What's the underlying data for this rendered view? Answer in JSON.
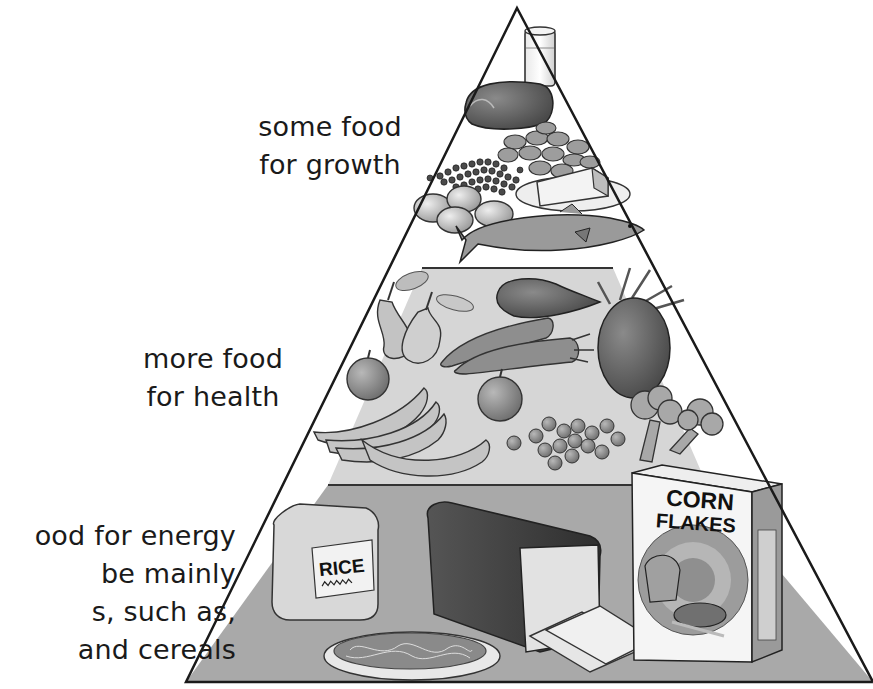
{
  "diagram": {
    "type": "food-pyramid",
    "colors": {
      "outline": "#1a1a1a",
      "tier_top": "#ffffff",
      "tier_middle": "#d6d6d6",
      "tier_bottom": "#a9a9a9"
    },
    "tiers": [
      {
        "id": "top",
        "label_lines": [
          "some food",
          "for growth"
        ],
        "foods": [
          "glass of milk",
          "meat",
          "beans",
          "lentils",
          "eggs",
          "cheese",
          "fish"
        ]
      },
      {
        "id": "middle",
        "label_lines": [
          "more food",
          "for health"
        ],
        "foods": [
          "pears",
          "sweet potato",
          "carrots",
          "pineapple",
          "apples",
          "bananas",
          "peas",
          "broccoli"
        ]
      },
      {
        "id": "bottom",
        "label_lines": [
          "ood for energy",
          "be mainly",
          "s, such as,",
          "and cereals"
        ],
        "foods": [
          "rice bag",
          "spaghetti",
          "bread loaf",
          "bread slices",
          "corn flakes box"
        ]
      }
    ],
    "package_text": {
      "rice": "RICE",
      "cereal_line1": "CORN",
      "cereal_line2": "FLAKES"
    }
  }
}
